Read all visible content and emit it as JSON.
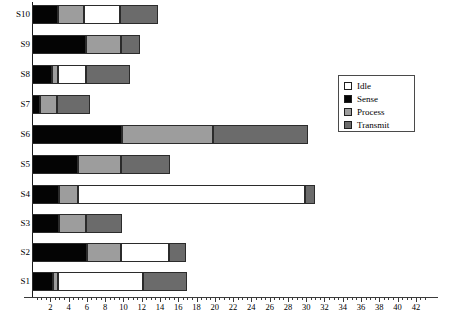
{
  "chart_data": {
    "type": "bar",
    "orientation": "horizontal",
    "stacked": true,
    "title": "",
    "xlabel": "",
    "ylabel": "",
    "xlim": [
      0,
      43
    ],
    "ylim": null,
    "grid": false,
    "legend_position": "right-upper",
    "categories": [
      "S1",
      "S2",
      "S3",
      "S4",
      "S5",
      "S6",
      "S7",
      "S8",
      "S9",
      "S10"
    ],
    "display_order": [
      "S10",
      "S9",
      "S8",
      "S7",
      "S6",
      "S5",
      "S4",
      "S3",
      "S2",
      "S1"
    ],
    "series": [
      {
        "name": "Sense",
        "color": "#040404",
        "values": [
          2.3,
          6.0,
          3.0,
          2.9,
          5.0,
          9.8,
          0.9,
          2.2,
          5.9,
          2.8
        ]
      },
      {
        "name": "Process",
        "color": "#9d9d9d",
        "values": [
          0.5,
          3.7,
          2.9,
          2.1,
          4.7,
          10.0,
          1.8,
          0.7,
          3.8,
          2.9
        ]
      },
      {
        "name": "Idle",
        "color": "#ffffff",
        "values": [
          9.4,
          5.3,
          0.0,
          24.9,
          0.0,
          0.0,
          0.0,
          3.0,
          0.0,
          3.9
        ]
      },
      {
        "name": "Transmit",
        "color": "#6b6b6b",
        "values": [
          4.8,
          1.9,
          3.9,
          1.1,
          5.4,
          10.4,
          3.7,
          4.8,
          2.1,
          4.2
        ]
      }
    ],
    "segment_order": [
      "Sense",
      "Process",
      "Idle",
      "Transmit"
    ],
    "totals": [
      17.0,
      16.9,
      9.8,
      31.0,
      15.1,
      30.2,
      6.4,
      10.7,
      11.8,
      13.8
    ],
    "xticks": [
      2,
      4,
      6,
      8,
      10,
      12,
      14,
      16,
      18,
      20,
      22,
      24,
      26,
      28,
      30,
      32,
      34,
      36,
      38,
      40,
      42
    ],
    "xtick_labels": [
      "2",
      "4",
      "6",
      "8",
      "10",
      "12",
      "14",
      "16",
      "18",
      "20",
      "22",
      "24",
      "26",
      "28",
      "30",
      "32",
      "34",
      "36",
      "38",
      "40",
      "42"
    ],
    "minor_tick_step": 0.5
  },
  "legend": {
    "entries": [
      {
        "label": "Idle",
        "key": "idle"
      },
      {
        "label": "Sense",
        "key": "sense"
      },
      {
        "label": "Process",
        "key": "process"
      },
      {
        "label": "Transmit",
        "key": "transmit"
      }
    ]
  }
}
